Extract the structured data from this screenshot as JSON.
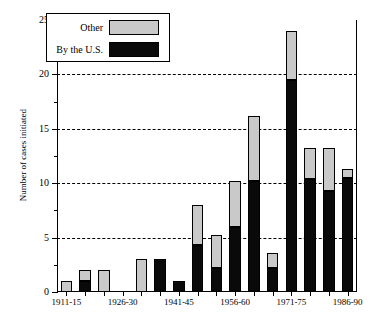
{
  "chart_data": {
    "type": "bar",
    "stacked": true,
    "title": "",
    "xlabel": "",
    "ylabel": "Number of cases initiated",
    "ylim": [
      0,
      25
    ],
    "ytick_values": [
      0,
      5,
      10,
      15,
      20,
      25
    ],
    "ytick_labels": [
      "0",
      "5",
      "10",
      "15",
      "20",
      "25"
    ],
    "yminor_step": 2.5,
    "grid": "horizontal-dashed",
    "legend_position": "upper-left-inside",
    "categories": [
      "1911-15",
      "1916-20",
      "1921-25",
      "1926-30",
      "1931-35",
      "1936-40",
      "1941-45",
      "1946-50",
      "1951-55",
      "1956-60",
      "1961-65",
      "1966-70",
      "1971-75",
      "1976-80",
      "1981-85",
      "1986-90"
    ],
    "xtick_labels_shown": [
      "1911-15",
      "1926-30",
      "1941-45",
      "1956-60",
      "1971-75",
      "1986-90"
    ],
    "series": [
      {
        "name": "By the U.S.",
        "color": "#0a0a0a",
        "values": [
          0,
          1,
          0,
          0,
          0,
          3,
          1,
          4.3,
          2.2,
          6,
          10.2,
          2.2,
          19.5,
          10.4,
          9.3,
          10.5
        ]
      },
      {
        "name": "Other",
        "color": "#c9c9c9",
        "values": [
          1,
          1,
          2,
          0,
          3,
          0,
          0,
          3.7,
          3,
          4.2,
          6,
          1.4,
          4.5,
          2.8,
          3.9,
          0.8
        ]
      }
    ],
    "totals": [
      1,
      2,
      2,
      0,
      3,
      3,
      1,
      8,
      5.2,
      10.2,
      16.2,
      3.6,
      24,
      13.2,
      13.2,
      11.3
    ]
  },
  "legend": {
    "items": [
      {
        "label": "Other",
        "swatch": "other"
      },
      {
        "label": "By the U.S.",
        "swatch": "us"
      }
    ]
  }
}
